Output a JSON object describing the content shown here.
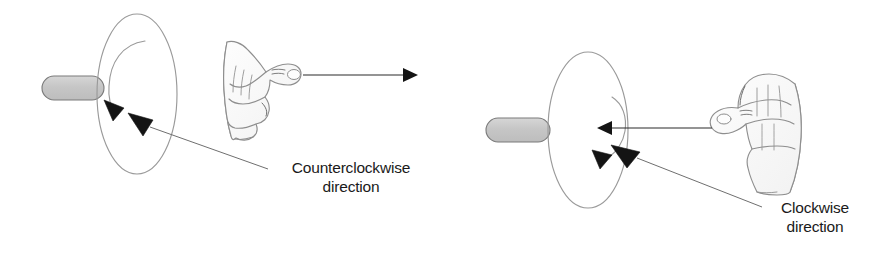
{
  "figure": {
    "background_color": "#ffffff",
    "ink_color": "#1a1a1a",
    "outline_color": "#8c8c8c",
    "shaft_fill_color": "#c9c9c9",
    "shaft_stroke_color": "#6e6e6e",
    "hand_stroke_color": "#8a8a8a",
    "hand_fill_color": "#fbfbfb"
  },
  "panels": [
    {
      "id": "left-panel",
      "name": "counterclockwise-panel",
      "label_lines": [
        "Counterclockwise",
        "direction"
      ],
      "label_text": "Counterclockwise direction",
      "thumb_arrow_direction": "right",
      "rotation_sense": "counterclockwise",
      "hand_type": "right-hand",
      "disk": {
        "cx": 137,
        "cy": 94,
        "rx": 40,
        "ry": 80
      },
      "shaft": {
        "x": 42,
        "y": 76,
        "width": 60,
        "height": 24
      },
      "thumb_arrow": {
        "x1": 303,
        "y1": 75,
        "x2": 415,
        "y2": 75
      },
      "leader_line": {
        "x1": 150,
        "y1": 127,
        "x2": 268,
        "y2": 170
      }
    },
    {
      "id": "right-panel",
      "name": "clockwise-panel",
      "label_lines": [
        "Clockwise",
        "direction"
      ],
      "label_text": "Clockwise direction",
      "thumb_arrow_direction": "left",
      "rotation_sense": "clockwise",
      "hand_type": "right-hand",
      "disk": {
        "cx": 588,
        "cy": 130,
        "rx": 40,
        "ry": 78
      },
      "shaft": {
        "x": 486,
        "y": 118,
        "width": 62,
        "height": 24
      },
      "thumb_arrow": {
        "x1": 712,
        "y1": 128,
        "x2": 595,
        "y2": 128
      },
      "leader_line": {
        "x1": 637,
        "y1": 160,
        "x2": 762,
        "y2": 208
      }
    }
  ],
  "icons": {
    "arrowhead": "solid-triangle",
    "rotation_arc": "curved-arrow",
    "hand": "hand-thumb-extended",
    "shaft": "rounded-rod",
    "disk": "ellipse-outline"
  }
}
